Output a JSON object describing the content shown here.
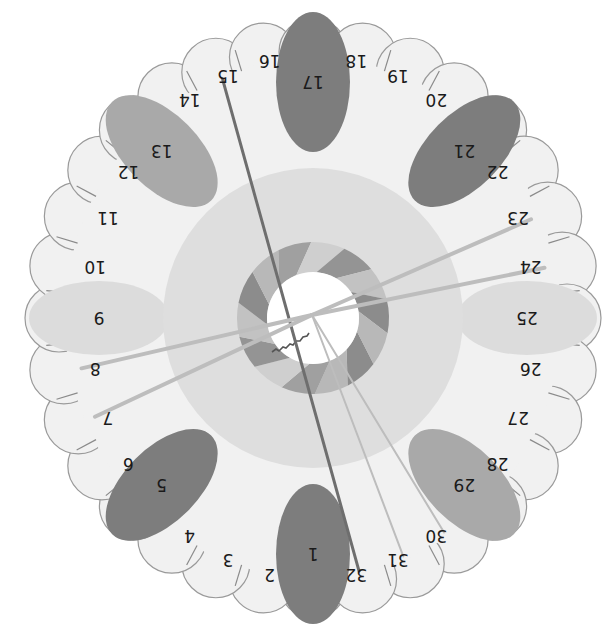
{
  "diagram": {
    "title": "",
    "center": {
      "x": 313,
      "y": 318
    },
    "rotation_deg": 180,
    "petal_count": 32,
    "outer_radius_x": 276,
    "outer_radius_y": 288,
    "label_radius_x": 222,
    "label_radius_y": 262,
    "rings": {
      "outer_band": {
        "r": 150,
        "color": "#dedede"
      },
      "striped_ring": {
        "r_outer": 76,
        "r_inner": 46,
        "colors": [
          "#8c8c8c",
          "#b8b8b8",
          "#a0a0a0",
          "#cfcfcf",
          "#949494",
          "#c2c2c2"
        ]
      },
      "hub": {
        "r": 46,
        "color": "#ffffff"
      }
    },
    "colors": {
      "petal_fill": "#f1f1f1",
      "petal_stroke": "#9a9a9a",
      "highlight_dark": "#7d7d7d",
      "highlight_mid": "#a9a9a9",
      "highlight_light": "#dcdcdc",
      "line_dark": "#6e6e6e",
      "line_light": "#bdbdbd"
    },
    "labels": [
      "1",
      "2",
      "3",
      "4",
      "5",
      "6",
      "7",
      "8",
      "9",
      "10",
      "11",
      "12",
      "13",
      "14",
      "15",
      "16",
      "17",
      "18",
      "19",
      "20",
      "21",
      "22",
      "23",
      "24",
      "25",
      "26",
      "27",
      "28",
      "29",
      "30",
      "31",
      "32"
    ],
    "highlights": [
      {
        "label": "1",
        "shade": "dark"
      },
      {
        "label": "5",
        "shade": "dark"
      },
      {
        "label": "9",
        "shade": "light"
      },
      {
        "label": "13",
        "shade": "mid"
      },
      {
        "label": "17",
        "shade": "dark"
      },
      {
        "label": "21",
        "shade": "dark"
      },
      {
        "label": "25",
        "shade": "light"
      },
      {
        "label": "29",
        "shade": "mid"
      }
    ],
    "connecting_lines": [
      {
        "from": "15",
        "to": "32",
        "shade": "dark",
        "width": 3
      },
      {
        "from": "center",
        "to": "23",
        "shade": "light",
        "width": 4
      },
      {
        "from": "center",
        "to": "24",
        "shade": "light",
        "width": 4
      },
      {
        "from": "center",
        "to": "7",
        "shade": "light",
        "width": 4
      },
      {
        "from": "center",
        "to": "8",
        "shade": "light",
        "width": 4
      },
      {
        "from": "center",
        "to": "30",
        "shade": "light",
        "width": 2
      },
      {
        "from": "center",
        "to": "31",
        "shade": "light",
        "width": 2
      }
    ]
  }
}
